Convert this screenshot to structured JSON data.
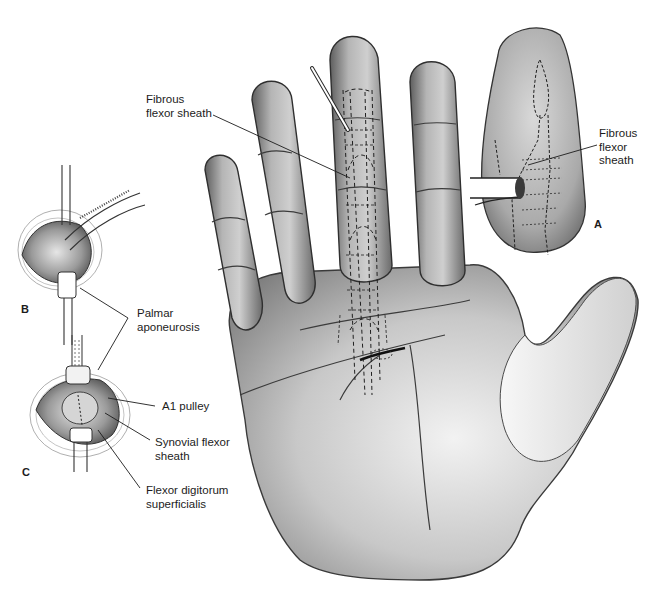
{
  "figure": {
    "panels": {
      "a": "A",
      "b": "B",
      "c": "C"
    },
    "labels": {
      "fibrous_sheath_main": "Fibrous\nflexor sheath",
      "fibrous_sheath_inset": "Fibrous\nflexor\nsheath",
      "palmar_aponeurosis": "Palmar\naponeurosis",
      "a1_pulley": "A1 pulley",
      "synovial_sheath": "Synovial flexor\nsheath",
      "fds": "Flexor digitorum\nsuperficialis"
    },
    "colors": {
      "ink": "#1c1c1c",
      "skin_dark": "#6e6e6e",
      "skin_mid": "#a8a8a8",
      "skin_light": "#e2e2e2"
    }
  }
}
